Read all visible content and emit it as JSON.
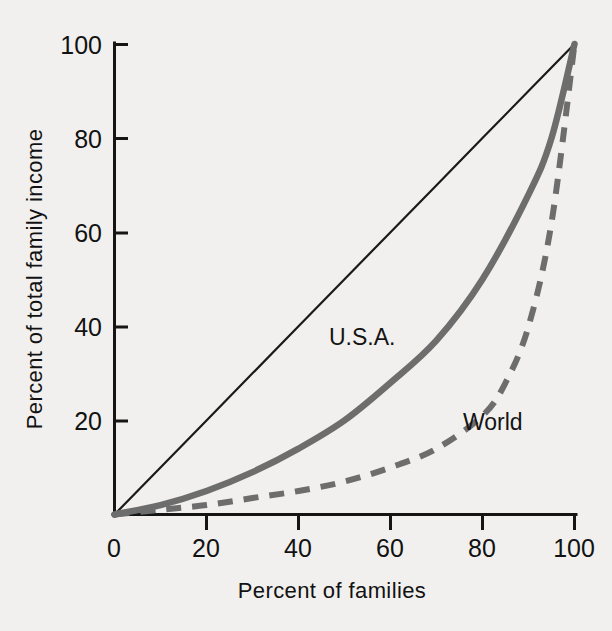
{
  "chart_data": {
    "type": "line",
    "title": "",
    "subtitle": "",
    "xlabel": "Percent of families",
    "ylabel": "Percent of total family income",
    "xlim": [
      0,
      100
    ],
    "ylim": [
      0,
      100
    ],
    "grid": false,
    "legend_position": "inline-annotation",
    "xticks": [
      0,
      20,
      40,
      60,
      80,
      100
    ],
    "xtick_labels": [
      "0",
      "20",
      "40",
      "60",
      "80",
      "100"
    ],
    "yticks": [
      0,
      20,
      40,
      60,
      80,
      100
    ],
    "ytick_labels": [
      "0",
      "20",
      "40",
      "60",
      "80",
      "100"
    ],
    "series": [
      {
        "name": "Line of equality",
        "style": "thin-solid-black",
        "color": "#1a1a1a",
        "labeled": false,
        "x": [
          0,
          10,
          20,
          30,
          40,
          50,
          60,
          70,
          80,
          90,
          100
        ],
        "values": [
          0,
          10,
          20,
          30,
          40,
          50,
          60,
          70,
          80,
          90,
          100
        ]
      },
      {
        "name": "U.S.A.",
        "style": "thick-solid-gray",
        "color": "#6d6d6d",
        "labeled": true,
        "x": [
          0,
          10,
          20,
          30,
          40,
          50,
          60,
          70,
          80,
          90,
          95,
          100
        ],
        "values": [
          0,
          2,
          5,
          9,
          14,
          20,
          28,
          37,
          50,
          68,
          80,
          100
        ]
      },
      {
        "name": "World",
        "style": "dashed-gray",
        "color": "#6d6d6d",
        "labeled": true,
        "x": [
          0,
          10,
          20,
          30,
          40,
          50,
          60,
          70,
          80,
          85,
          90,
          95,
          100
        ],
        "values": [
          0,
          1,
          2,
          3.5,
          5,
          7,
          10,
          14,
          21,
          28,
          40,
          62,
          100
        ]
      }
    ],
    "annotations": [
      {
        "text": "U.S.A.",
        "x": 58,
        "y": 37
      },
      {
        "text": "World",
        "x": 79,
        "y": 19
      }
    ]
  },
  "axes": {
    "x_title": "Percent of families",
    "y_title": "Percent of total family income",
    "x_tick_labels": [
      "0",
      "20",
      "40",
      "60",
      "80",
      "100"
    ],
    "y_tick_labels": [
      "20",
      "40",
      "60",
      "80",
      "100"
    ]
  },
  "labels": {
    "usa": "U.S.A.",
    "world": "World"
  },
  "colors": {
    "background": "#f1f0ee",
    "axis": "#151515",
    "equality": "#1a1a1a",
    "usa": "#6d6d6d",
    "world": "#6d6d6d",
    "text": "#121212"
  }
}
